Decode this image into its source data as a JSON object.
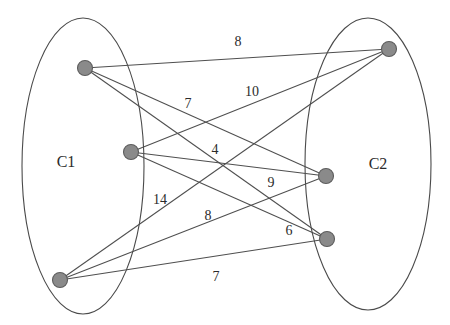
{
  "figure": {
    "type": "bipartite-weighted-graph",
    "width": 450,
    "height": 325,
    "background_color": "#ffffff"
  },
  "clusters": [
    {
      "id": "C1",
      "label": "C1",
      "label_x": 66,
      "label_y": 162,
      "ellipse": {
        "cx": 83,
        "cy": 166,
        "rx": 61,
        "ry": 148
      },
      "stroke_color": "#4a4a4a"
    },
    {
      "id": "C2",
      "label": "C2",
      "label_x": 378,
      "label_y": 164,
      "ellipse": {
        "cx": 368,
        "cy": 164,
        "rx": 63,
        "ry": 146
      },
      "stroke_color": "#4a4a4a"
    }
  ],
  "nodes": [
    {
      "id": "L1",
      "cluster": "C1",
      "x": 85,
      "y": 68,
      "r": 7.5
    },
    {
      "id": "L2",
      "cluster": "C1",
      "x": 131,
      "y": 152,
      "r": 7.5
    },
    {
      "id": "L3",
      "cluster": "C1",
      "x": 60,
      "y": 280,
      "r": 7.5
    },
    {
      "id": "R1",
      "cluster": "C2",
      "x": 389,
      "y": 49,
      "r": 7.5
    },
    {
      "id": "R2",
      "cluster": "C2",
      "x": 326,
      "y": 176,
      "r": 7.5
    },
    {
      "id": "R3",
      "cluster": "C2",
      "x": 327,
      "y": 239,
      "r": 7.5
    }
  ],
  "edges": [
    {
      "id": "e1",
      "source": "L1",
      "target": "R1",
      "weight": "8",
      "label_x": 238,
      "label_y": 42
    },
    {
      "id": "e2",
      "source": "L1",
      "target": "R2",
      "weight": "7",
      "label_x": 188,
      "label_y": 104
    },
    {
      "id": "e3",
      "source": "L1",
      "target": "R3",
      "weight": "4",
      "label_x": 215,
      "label_y": 150
    },
    {
      "id": "e4",
      "source": "L2",
      "target": "R1",
      "weight": "10",
      "label_x": 252,
      "label_y": 92
    },
    {
      "id": "e5",
      "source": "L2",
      "target": "R2",
      "weight": "9",
      "label_x": 271,
      "label_y": 183
    },
    {
      "id": "e6",
      "source": "L2",
      "target": "R3",
      "weight": "6",
      "label_x": 289,
      "label_y": 231
    },
    {
      "id": "e7",
      "source": "L3",
      "target": "R1",
      "weight": "14",
      "label_x": 160,
      "label_y": 200
    },
    {
      "id": "e8",
      "source": "L3",
      "target": "R2",
      "weight": "8",
      "label_x": 208,
      "label_y": 216
    },
    {
      "id": "e9",
      "source": "L3",
      "target": "R3",
      "weight": "7",
      "label_x": 216,
      "label_y": 277
    }
  ],
  "colors": {
    "node_fill": "#8a8a8a",
    "node_stroke": "#5c5c5c",
    "edge_stroke": "#4f4f4f",
    "ellipse_stroke": "#4a4a4a",
    "text": "#2b2b2b"
  }
}
